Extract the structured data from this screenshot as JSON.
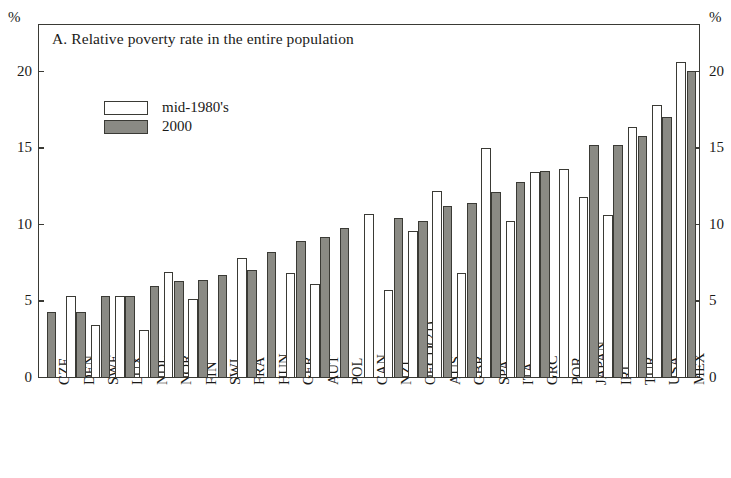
{
  "chart_data": {
    "type": "bar",
    "title": "A. Relative poverty rate in the entire population",
    "xlabel": "",
    "ylabel": "%",
    "yunit_left": "%",
    "yunit_right": "%",
    "ylim": [
      0,
      23
    ],
    "yticks": [
      0,
      5,
      10,
      15,
      20
    ],
    "ytick_labels": [
      "0",
      "5",
      "10",
      "15",
      "20"
    ],
    "grid": false,
    "legend_position": "upper-left-inside",
    "categories": [
      "CZE",
      "DEN",
      "SWE",
      "LUX",
      "NDL",
      "NOR",
      "FIN",
      "SWI",
      "FRA",
      "HUN",
      "GER",
      "AUT",
      "POL",
      "CAN",
      "NZL",
      "OECD(21)",
      "AUS",
      "GBR",
      "SPA",
      "ITA",
      "GRC",
      "POR",
      "JAPAN",
      "IRL",
      "TUR",
      "USA",
      "MEX"
    ],
    "series": [
      {
        "name": "mid-1980's",
        "color": "#ffffff",
        "values": [
          null,
          5.3,
          3.4,
          5.3,
          3.1,
          6.9,
          5.1,
          null,
          7.8,
          null,
          6.8,
          6.1,
          null,
          10.7,
          5.7,
          9.6,
          12.2,
          6.8,
          15.0,
          10.2,
          13.4,
          13.6,
          11.8,
          10.6,
          16.4,
          17.8,
          20.6
        ]
      },
      {
        "name": "2000",
        "color": "#8a8a84",
        "values": [
          4.3,
          4.3,
          5.3,
          5.3,
          6.0,
          6.3,
          6.4,
          6.7,
          7.0,
          8.2,
          8.9,
          9.2,
          9.8,
          null,
          10.4,
          10.2,
          11.2,
          11.4,
          12.1,
          12.8,
          13.5,
          null,
          15.2,
          15.2,
          15.8,
          17.0,
          20.0
        ]
      }
    ]
  },
  "legend": {
    "items": [
      {
        "label": "mid-1980's",
        "swatch": "white"
      },
      {
        "label": "2000",
        "swatch": "gray"
      }
    ]
  }
}
